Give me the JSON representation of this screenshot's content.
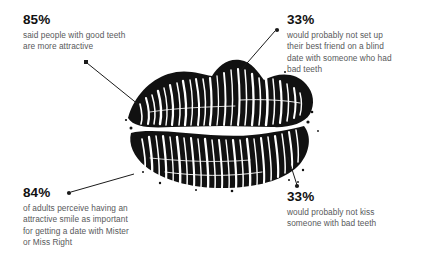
{
  "graphic": {
    "subject": "lipstick-kiss-print",
    "ink_color": "#111111",
    "background_color": "#ffffff"
  },
  "theme": {
    "value_color": "#111111",
    "description_color": "#58595b",
    "connector_color": "#1a1a1a"
  },
  "stats": {
    "top_left": {
      "value": "85%",
      "description": "said people with good teeth\nare more attractive"
    },
    "top_right": {
      "value": "33%",
      "description": "would probably not set up\ntheir best friend on a blind\ndate with someone who had\nbad teeth"
    },
    "bottom_left": {
      "value": "84%",
      "description": "of adults perceive having an\nattractive smile as important\nfor getting a date with Mister\nor Miss Right"
    },
    "bottom_right": {
      "value": "33%",
      "description": "would probably not kiss\nsomeone with bad teeth"
    }
  }
}
